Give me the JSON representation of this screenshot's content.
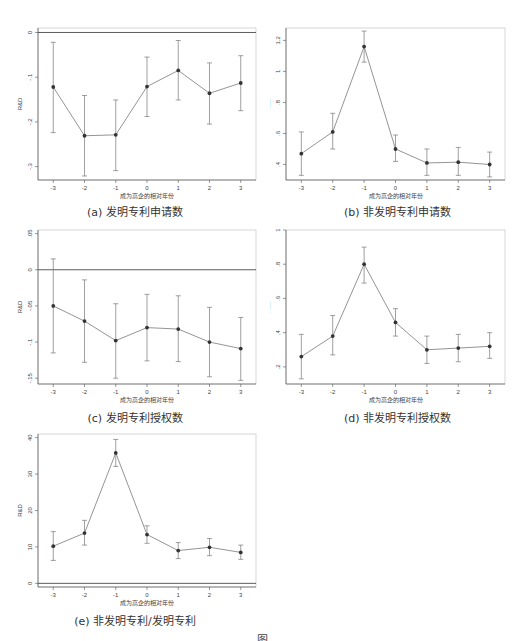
{
  "figure": {
    "caption_fragment": "图"
  },
  "chart_data": [
    {
      "id": "a",
      "type": "line",
      "caption": "(a)  发明专利申请数",
      "xlabel": "成为高企的相对年份",
      "ylabel": "R&D",
      "x": [
        -3,
        -2,
        -1,
        0,
        1,
        2,
        3
      ],
      "values": [
        -0.122,
        -0.231,
        -0.229,
        -0.121,
        -0.085,
        -0.136,
        -0.113
      ],
      "ci_upper": [
        -0.022,
        -0.141,
        -0.151,
        -0.055,
        -0.018,
        -0.068,
        -0.052
      ],
      "ci_lower": [
        -0.224,
        -0.321,
        -0.309,
        -0.188,
        -0.151,
        -0.205,
        -0.175
      ],
      "yticks": [
        0,
        -0.1,
        -0.2,
        -0.3
      ],
      "ytick_labels": [
        "0",
        "-.1",
        "-.2",
        "-.3"
      ],
      "ylim": [
        -0.33,
        0.01
      ],
      "hline": 0,
      "grid": false
    },
    {
      "id": "b",
      "type": "line",
      "caption": "(b)  非发明专利申请数",
      "xlabel": "成为高企的相对年份",
      "ylabel": "R&D",
      "x": [
        -3,
        -2,
        -1,
        0,
        1,
        2,
        3
      ],
      "values": [
        0.47,
        0.61,
        1.16,
        0.5,
        0.41,
        0.415,
        0.4
      ],
      "ci_upper": [
        0.61,
        0.73,
        1.26,
        0.59,
        0.5,
        0.51,
        0.48
      ],
      "ci_lower": [
        0.33,
        0.5,
        1.06,
        0.42,
        0.33,
        0.33,
        0.32
      ],
      "yticks": [
        1.2,
        1.0,
        0.8,
        0.6,
        0.4
      ],
      "ytick_labels": [
        "1.2",
        "1",
        ".8",
        ".6",
        ".4"
      ],
      "ylim": [
        0.3,
        1.28
      ],
      "grid": false
    },
    {
      "id": "c",
      "type": "line",
      "caption": "(c)  发明专利授权数",
      "xlabel": "成为高企的相对年份",
      "ylabel": "R&D",
      "x": [
        -3,
        -2,
        -1,
        0,
        1,
        2,
        3
      ],
      "values": [
        -0.05,
        -0.071,
        -0.098,
        -0.08,
        -0.082,
        -0.1,
        -0.109
      ],
      "ci_upper": [
        0.015,
        -0.014,
        -0.047,
        -0.034,
        -0.036,
        -0.052,
        -0.066
      ],
      "ci_lower": [
        -0.115,
        -0.128,
        -0.15,
        -0.126,
        -0.127,
        -0.148,
        -0.153
      ],
      "yticks": [
        0.05,
        0,
        -0.05,
        -0.1,
        -0.15
      ],
      "ytick_labels": [
        ".05",
        "0",
        "-.05",
        "-.1",
        "-.15"
      ],
      "ylim": [
        -0.158,
        0.055
      ],
      "hline": 0,
      "grid": false
    },
    {
      "id": "d",
      "type": "line",
      "caption": "(d)  非发明专利授权数",
      "xlabel": "成为高企的相对年份",
      "ylabel": "R&D",
      "x": [
        -3,
        -2,
        -1,
        0,
        1,
        2,
        3
      ],
      "values": [
        0.26,
        0.38,
        0.8,
        0.46,
        0.3,
        0.31,
        0.32
      ],
      "ci_upper": [
        0.39,
        0.5,
        0.9,
        0.54,
        0.38,
        0.39,
        0.4
      ],
      "ci_lower": [
        0.13,
        0.27,
        0.69,
        0.38,
        0.22,
        0.23,
        0.25
      ],
      "yticks": [
        1.0,
        0.8,
        0.6,
        0.4,
        0.2
      ],
      "ytick_labels": [
        "1",
        ".8",
        ".6",
        ".4",
        ".2"
      ],
      "ylim": [
        0.1,
        1.0
      ],
      "grid": false
    },
    {
      "id": "e",
      "type": "line",
      "caption": "(e)  非发明专利/发明专利",
      "xlabel": "成为高企的相对年份",
      "ylabel": "R&D",
      "x": [
        -3,
        -2,
        -1,
        0,
        1,
        2,
        3
      ],
      "values": [
        10.2,
        13.8,
        35.8,
        13.4,
        9.0,
        9.9,
        8.5
      ],
      "ci_upper": [
        14.2,
        17.3,
        39.5,
        15.8,
        11.2,
        12.3,
        10.5
      ],
      "ci_lower": [
        6.3,
        10.5,
        32.1,
        11.0,
        6.8,
        7.6,
        6.6
      ],
      "yticks": [
        40,
        30,
        20,
        10,
        0
      ],
      "ytick_labels": [
        "40",
        "30",
        "20",
        "10",
        "0"
      ],
      "ylim": [
        -1,
        41
      ],
      "hline": 0,
      "grid": false
    }
  ]
}
